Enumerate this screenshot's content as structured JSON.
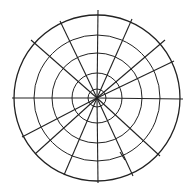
{
  "diagram": {
    "type": "polar-grid",
    "center": [
      97,
      98
    ],
    "rings": [
      9,
      25,
      45,
      63,
      83
    ],
    "stroke_color": "#222222",
    "background": "#ffffff",
    "spokes": [
      [
        97,
        98,
        98,
        10
      ],
      [
        97,
        98,
        98,
        183
      ],
      [
        97,
        98,
        12,
        98
      ],
      [
        97,
        98,
        183,
        99
      ],
      [
        97,
        98,
        31,
        40
      ],
      [
        97,
        98,
        60,
        21
      ],
      [
        97,
        98,
        132,
        19
      ],
      [
        97,
        98,
        165,
        40
      ],
      [
        97,
        98,
        174,
        61
      ],
      [
        97,
        98,
        22,
        137
      ],
      [
        97,
        98,
        35,
        154
      ],
      [
        97,
        98,
        64,
        175
      ],
      [
        97,
        98,
        160,
        156
      ],
      [
        97,
        98,
        133,
        176
      ],
      [
        120,
        152,
        125,
        160
      ]
    ]
  }
}
